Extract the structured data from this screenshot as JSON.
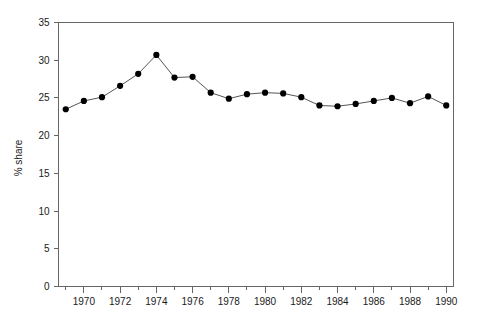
{
  "chart_data": {
    "type": "line",
    "title": "",
    "xlabel": "",
    "ylabel": "% share",
    "xlim": [
      1968.6,
      1990.4
    ],
    "ylim": [
      0,
      35
    ],
    "grid": false,
    "legend": "none",
    "x_tick_labels": [
      "1970",
      "1972",
      "1974",
      "1976",
      "1978",
      "1980",
      "1982",
      "1984",
      "1986",
      "1988",
      "1990"
    ],
    "x_tick_values": [
      1970,
      1972,
      1974,
      1976,
      1978,
      1980,
      1982,
      1984,
      1986,
      1988,
      1990
    ],
    "x_minor_ticks": [
      1969,
      1971,
      1973,
      1975,
      1977,
      1979,
      1981,
      1983,
      1985,
      1987,
      1989
    ],
    "y_tick_labels": [
      "0",
      "5",
      "10",
      "15",
      "20",
      "25",
      "30",
      "35"
    ],
    "y_tick_values": [
      0,
      5,
      10,
      15,
      20,
      25,
      30,
      35
    ],
    "x": [
      1969,
      1970,
      1971,
      1972,
      1973,
      1974,
      1975,
      1976,
      1977,
      1978,
      1979,
      1980,
      1981,
      1982,
      1983,
      1984,
      1985,
      1986,
      1987,
      1988,
      1989,
      1990
    ],
    "values": [
      23.5,
      24.6,
      25.1,
      26.6,
      28.2,
      30.7,
      27.7,
      27.8,
      25.7,
      24.9,
      25.5,
      25.7,
      25.6,
      25.1,
      24.0,
      23.9,
      24.2,
      24.6,
      25.0,
      24.3,
      25.2,
      24.0
    ],
    "series": [
      {
        "name": "% share",
        "values": [
          23.5,
          24.6,
          25.1,
          26.6,
          28.2,
          30.7,
          27.7,
          27.8,
          25.7,
          24.9,
          25.5,
          25.7,
          25.6,
          25.1,
          24.0,
          23.9,
          24.2,
          24.6,
          25.0,
          24.3,
          25.2,
          24.0
        ],
        "marker": "filled-circle",
        "line_color": "#555555",
        "marker_color": "#000000"
      }
    ]
  },
  "colors": {
    "axis": "#666666",
    "line": "#555555",
    "marker": "#000000",
    "text": "#1a1a1a",
    "background": "#ffffff"
  }
}
